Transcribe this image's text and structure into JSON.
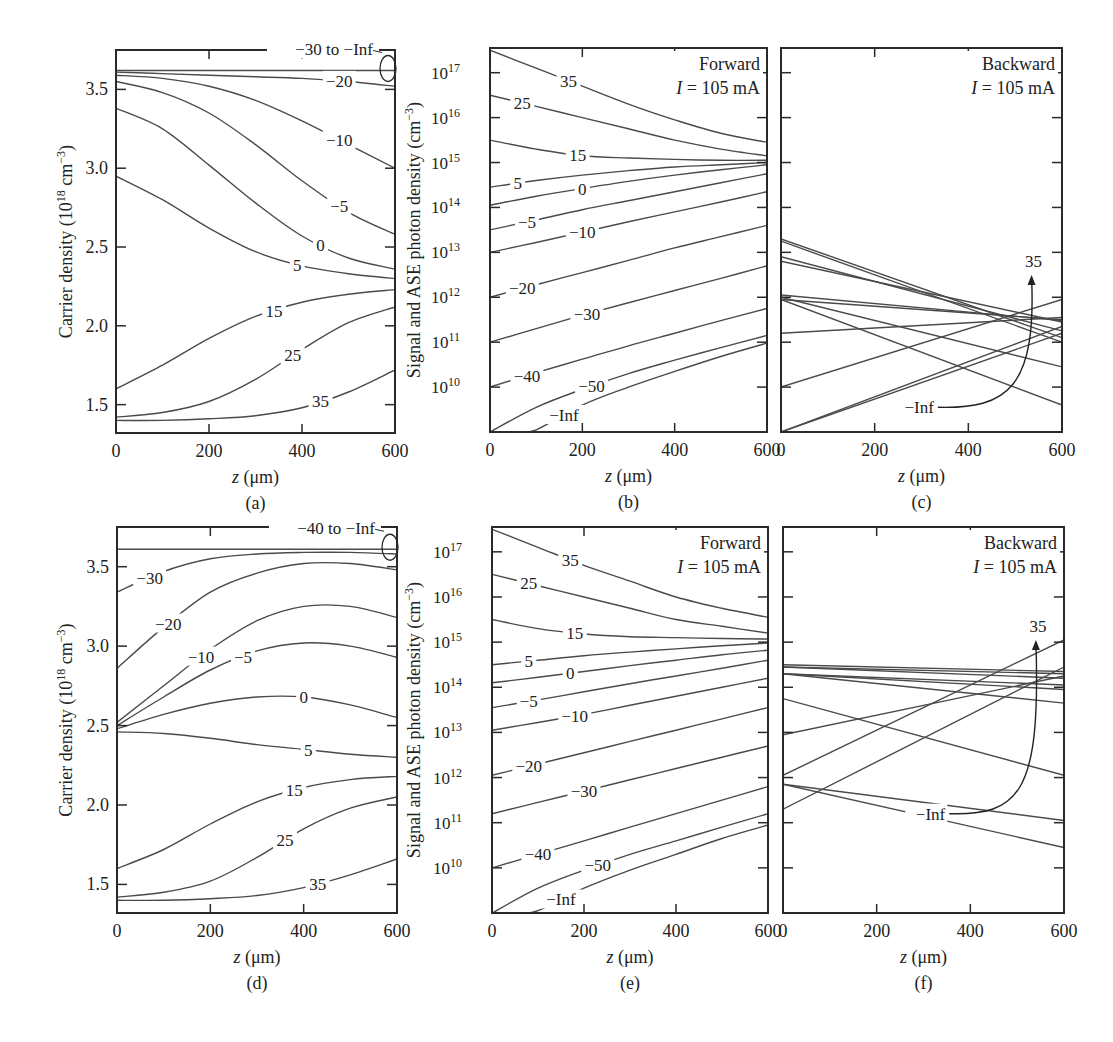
{
  "figure": {
    "line_color": "#4a4a4a",
    "axis_color": "#2a2a2a",
    "text_color": "#222222"
  },
  "chart_data": [
    {
      "id": "a",
      "panel_label": "(a)",
      "type": "line",
      "title": "",
      "xlabel": "z (μm)",
      "ylabel": "Carrier density (10^18 cm^-3)",
      "xlim": [
        0,
        600
      ],
      "ylim": [
        1.32,
        3.75
      ],
      "yscale": "linear",
      "xticks": [
        0,
        200,
        400,
        600
      ],
      "yticks": [
        1.5,
        2.0,
        2.5,
        3.0,
        3.5
      ],
      "ytick_labels": [
        "1.5",
        "2.0",
        "2.5",
        "3.0",
        "3.5"
      ],
      "grid": false,
      "annotation": "−30 to −Inf",
      "x": [
        0,
        100,
        200,
        300,
        400,
        500,
        600
      ],
      "series": [
        {
          "name": "−30 to −Inf",
          "values": [
            3.62,
            3.62,
            3.62,
            3.62,
            3.62,
            3.62,
            3.62
          ]
        },
        {
          "name": "−20",
          "values": [
            3.61,
            3.6,
            3.59,
            3.58,
            3.57,
            3.55,
            3.52
          ]
        },
        {
          "name": "−10",
          "values": [
            3.59,
            3.57,
            3.52,
            3.43,
            3.3,
            3.15,
            3.0
          ]
        },
        {
          "name": "−5",
          "values": [
            3.55,
            3.48,
            3.35,
            3.15,
            2.92,
            2.72,
            2.58
          ]
        },
        {
          "name": "0",
          "values": [
            3.38,
            3.25,
            3.02,
            2.78,
            2.57,
            2.43,
            2.36
          ]
        },
        {
          "name": "5",
          "values": [
            2.95,
            2.8,
            2.62,
            2.47,
            2.38,
            2.33,
            2.3
          ]
        },
        {
          "name": "15",
          "values": [
            1.6,
            1.75,
            1.92,
            2.06,
            2.15,
            2.2,
            2.23
          ]
        },
        {
          "name": "25",
          "values": [
            1.42,
            1.45,
            1.52,
            1.66,
            1.85,
            2.02,
            2.12
          ]
        },
        {
          "name": "35",
          "values": [
            1.4,
            1.4,
            1.41,
            1.43,
            1.48,
            1.58,
            1.72
          ]
        }
      ],
      "labels_at": [
        {
          "name": "−20",
          "x": 480
        },
        {
          "name": "−10",
          "x": 480
        },
        {
          "name": "−5",
          "x": 480
        },
        {
          "name": "0",
          "x": 440
        },
        {
          "name": "5",
          "x": 390
        },
        {
          "name": "15",
          "x": 340
        },
        {
          "name": "25",
          "x": 380
        },
        {
          "name": "35",
          "x": 440
        }
      ]
    },
    {
      "id": "b",
      "panel_label": "(b)",
      "type": "line",
      "title": "Forward",
      "subtitle": "I = 105 mA",
      "xlabel": "z (μm)",
      "ylabel": "Signal and ASE photon density (cm^-3)",
      "xlim": [
        0,
        600
      ],
      "ylim": [
        9.0,
        17.55
      ],
      "yscale": "log10",
      "xticks": [
        0,
        200,
        400,
        600
      ],
      "yticks": [
        10,
        11,
        12,
        13,
        14,
        15,
        16,
        17
      ],
      "ytick_labels": [
        "10^10",
        "10^11",
        "10^12",
        "10^13",
        "10^14",
        "10^15",
        "10^16",
        "10^17"
      ],
      "grid": false,
      "x": [
        0,
        100,
        200,
        300,
        400,
        500,
        600
      ],
      "series": [
        {
          "name": "35",
          "values": [
            17.5,
            17.1,
            16.7,
            16.3,
            15.95,
            15.65,
            15.45
          ]
        },
        {
          "name": "25",
          "values": [
            16.5,
            16.25,
            16.0,
            15.75,
            15.5,
            15.3,
            15.15
          ]
        },
        {
          "name": "15",
          "values": [
            15.5,
            15.3,
            15.15,
            15.1,
            15.07,
            15.05,
            15.05
          ]
        },
        {
          "name": "5",
          "values": [
            14.45,
            14.6,
            14.72,
            14.82,
            14.9,
            14.95,
            15.0
          ]
        },
        {
          "name": "0",
          "values": [
            14.05,
            14.25,
            14.42,
            14.58,
            14.72,
            14.84,
            14.95
          ]
        },
        {
          "name": "−5",
          "values": [
            13.5,
            13.72,
            13.95,
            14.15,
            14.35,
            14.55,
            14.75
          ]
        },
        {
          "name": "−10",
          "values": [
            13.0,
            13.22,
            13.45,
            13.68,
            13.9,
            14.12,
            14.35
          ]
        },
        {
          "name": "−20",
          "values": [
            12.0,
            12.28,
            12.55,
            12.82,
            13.1,
            13.35,
            13.6
          ]
        },
        {
          "name": "−30",
          "values": [
            11.0,
            11.3,
            11.6,
            11.88,
            12.15,
            12.42,
            12.7
          ]
        },
        {
          "name": "−40",
          "values": [
            10.0,
            10.32,
            10.62,
            10.92,
            11.2,
            11.48,
            11.75
          ]
        },
        {
          "name": "−50",
          "values": [
            9.0,
            9.55,
            9.95,
            10.3,
            10.6,
            10.88,
            11.15
          ]
        },
        {
          "name": "−Inf",
          "values": [
            null,
            9.05,
            9.6,
            10.0,
            10.35,
            10.68,
            10.98
          ]
        }
      ],
      "labels_at": [
        {
          "name": "35",
          "x": 170
        },
        {
          "name": "25",
          "x": 70
        },
        {
          "name": "15",
          "x": 190
        },
        {
          "name": "5",
          "x": 60
        },
        {
          "name": "0",
          "x": 200
        },
        {
          "name": "−5",
          "x": 80
        },
        {
          "name": "−10",
          "x": 200
        },
        {
          "name": "−20",
          "x": 70
        },
        {
          "name": "−30",
          "x": 210
        },
        {
          "name": "−40",
          "x": 80
        },
        {
          "name": "−50",
          "x": 220
        },
        {
          "name": "−Inf",
          "x": 160
        }
      ]
    },
    {
      "id": "c",
      "panel_label": "(c)",
      "type": "line",
      "title": "Backward",
      "subtitle": "I = 105 mA",
      "xlabel": "z (μm)",
      "ylabel": "",
      "xlim": [
        0,
        600
      ],
      "ylim": [
        9.0,
        17.55
      ],
      "yscale": "log10",
      "xticks": [
        0,
        200,
        400,
        600
      ],
      "yticks": [
        10,
        11,
        12,
        13,
        14,
        15,
        16,
        17
      ],
      "grid": false,
      "annotation": "−Inf → 35 (arrow)",
      "x": [
        0,
        600
      ],
      "series": [
        {
          "name": "35",
          "values": [
            10.0,
            11.95
          ]
        },
        {
          "name": "25",
          "values": [
            9.0,
            11.35
          ]
        },
        {
          "name": "15",
          "values": [
            9.0,
            11.2
          ]
        },
        {
          "name": "5",
          "values": [
            11.2,
            11.55
          ]
        },
        {
          "name": "0",
          "values": [
            11.95,
            11.5
          ]
        },
        {
          "name": "−5",
          "values": [
            12.05,
            11.48
          ]
        },
        {
          "name": "−10",
          "values": [
            12.8,
            11.45
          ]
        },
        {
          "name": "−20",
          "values": [
            12.9,
            11.25
          ]
        },
        {
          "name": "−30",
          "values": [
            13.3,
            11.1
          ]
        },
        {
          "name": "−40",
          "values": [
            13.25,
            11.0
          ]
        },
        {
          "name": "−50",
          "values": [
            12.0,
            10.45
          ]
        },
        {
          "name": "−Inf",
          "values": [
            11.95,
            9.6
          ]
        }
      ]
    },
    {
      "id": "d",
      "panel_label": "(d)",
      "type": "line",
      "title": "",
      "xlabel": "z (μm)",
      "ylabel": "Carrier density (10^18 cm^-3)",
      "xlim": [
        0,
        600
      ],
      "ylim": [
        1.32,
        3.75
      ],
      "yscale": "linear",
      "xticks": [
        0,
        200,
        400,
        600
      ],
      "yticks": [
        1.5,
        2.0,
        2.5,
        3.0,
        3.5
      ],
      "ytick_labels": [
        "1.5",
        "2.0",
        "2.5",
        "3.0",
        "3.5"
      ],
      "grid": false,
      "annotation": "−40 to −Inf",
      "x": [
        0,
        100,
        200,
        300,
        400,
        500,
        600
      ],
      "series": [
        {
          "name": "−40 to −Inf",
          "values": [
            3.61,
            3.61,
            3.61,
            3.61,
            3.61,
            3.61,
            3.61
          ]
        },
        {
          "name": "−30",
          "values": [
            3.34,
            3.47,
            3.55,
            3.58,
            3.59,
            3.59,
            3.58
          ]
        },
        {
          "name": "−20",
          "values": [
            2.86,
            3.12,
            3.34,
            3.46,
            3.52,
            3.52,
            3.48
          ]
        },
        {
          "name": "−10",
          "values": [
            2.52,
            2.75,
            2.98,
            3.16,
            3.25,
            3.25,
            3.18
          ]
        },
        {
          "name": "−5",
          "values": [
            2.5,
            2.68,
            2.85,
            2.97,
            3.02,
            3.0,
            2.93
          ]
        },
        {
          "name": "0",
          "values": [
            2.48,
            2.57,
            2.64,
            2.68,
            2.68,
            2.63,
            2.55
          ]
        },
        {
          "name": "5",
          "values": [
            2.46,
            2.45,
            2.42,
            2.38,
            2.35,
            2.32,
            2.3
          ]
        },
        {
          "name": "15",
          "values": [
            1.6,
            1.72,
            1.88,
            2.02,
            2.11,
            2.16,
            2.18
          ]
        },
        {
          "name": "25",
          "values": [
            1.42,
            1.45,
            1.52,
            1.67,
            1.85,
            1.98,
            2.05
          ]
        },
        {
          "name": "35",
          "values": [
            1.4,
            1.4,
            1.41,
            1.43,
            1.48,
            1.56,
            1.66
          ]
        }
      ],
      "labels_at": [
        {
          "name": "−30",
          "x": 70
        },
        {
          "name": "−20",
          "x": 110
        },
        {
          "name": "−10",
          "x": 180
        },
        {
          "name": "−5",
          "x": 270
        },
        {
          "name": "0",
          "x": 400
        },
        {
          "name": "5",
          "x": 410
        },
        {
          "name": "15",
          "x": 380
        },
        {
          "name": "25",
          "x": 360
        },
        {
          "name": "35",
          "x": 430
        }
      ]
    },
    {
      "id": "e",
      "panel_label": "(e)",
      "type": "line",
      "title": "Forward",
      "subtitle": "I = 105 mA",
      "xlabel": "z (μm)",
      "ylabel": "Signal and ASE photon density (cm^-3)",
      "xlim": [
        0,
        600
      ],
      "ylim": [
        9.0,
        17.55
      ],
      "yscale": "log10",
      "xticks": [
        0,
        200,
        400,
        600
      ],
      "yticks": [
        10,
        11,
        12,
        13,
        14,
        15,
        16,
        17
      ],
      "ytick_labels": [
        "10^10",
        "10^11",
        "10^12",
        "10^13",
        "10^14",
        "10^15",
        "10^16",
        "10^17"
      ],
      "grid": false,
      "x": [
        0,
        100,
        200,
        300,
        400,
        500,
        600
      ],
      "series": [
        {
          "name": "35",
          "values": [
            17.5,
            17.1,
            16.7,
            16.35,
            16.0,
            15.75,
            15.55
          ]
        },
        {
          "name": "25",
          "values": [
            16.5,
            16.25,
            16.0,
            15.75,
            15.5,
            15.35,
            15.2
          ]
        },
        {
          "name": "15",
          "values": [
            15.5,
            15.3,
            15.18,
            15.12,
            15.1,
            15.08,
            15.07
          ]
        },
        {
          "name": "5",
          "values": [
            14.5,
            14.6,
            14.7,
            14.78,
            14.85,
            14.92,
            14.98
          ]
        },
        {
          "name": "0",
          "values": [
            14.1,
            14.22,
            14.35,
            14.48,
            14.6,
            14.72,
            14.82
          ]
        },
        {
          "name": "−5",
          "values": [
            13.55,
            13.72,
            13.9,
            14.08,
            14.25,
            14.42,
            14.6
          ]
        },
        {
          "name": "−10",
          "values": [
            13.05,
            13.22,
            13.4,
            13.6,
            13.8,
            14.0,
            14.2
          ]
        },
        {
          "name": "−20",
          "values": [
            12.05,
            12.3,
            12.55,
            12.8,
            13.05,
            13.3,
            13.55
          ]
        },
        {
          "name": "−30",
          "values": [
            11.2,
            11.45,
            11.7,
            11.95,
            12.2,
            12.45,
            12.7
          ]
        },
        {
          "name": "−40",
          "values": [
            10.0,
            10.3,
            10.6,
            10.9,
            11.2,
            11.5,
            11.8
          ]
        },
        {
          "name": "−50",
          "values": [
            9.0,
            9.55,
            9.95,
            10.3,
            10.6,
            10.9,
            11.2
          ]
        },
        {
          "name": "−Inf",
          "values": [
            null,
            9.05,
            9.55,
            9.95,
            10.3,
            10.65,
            10.95
          ]
        }
      ],
      "labels_at": [
        {
          "name": "35",
          "x": 170
        },
        {
          "name": "25",
          "x": 80
        },
        {
          "name": "15",
          "x": 180
        },
        {
          "name": "5",
          "x": 80
        },
        {
          "name": "0",
          "x": 170
        },
        {
          "name": "−5",
          "x": 80
        },
        {
          "name": "−10",
          "x": 180
        },
        {
          "name": "−20",
          "x": 80
        },
        {
          "name": "−30",
          "x": 200
        },
        {
          "name": "−40",
          "x": 100
        },
        {
          "name": "−50",
          "x": 230
        },
        {
          "name": "−Inf",
          "x": 150
        }
      ]
    },
    {
      "id": "f",
      "panel_label": "(f)",
      "type": "line",
      "title": "Backward",
      "subtitle": "I = 105 mA",
      "xlabel": "z (μm)",
      "ylabel": "",
      "xlim": [
        0,
        600
      ],
      "ylim": [
        9.0,
        17.55
      ],
      "yscale": "log10",
      "xticks": [
        0,
        200,
        400,
        600
      ],
      "yticks": [
        10,
        11,
        12,
        13,
        14,
        15,
        16,
        17
      ],
      "grid": false,
      "annotation": "−Inf → 35 (arrow)",
      "x": [
        0,
        600
      ],
      "series": [
        {
          "name": "35",
          "values": [
            12.05,
            15.05
          ]
        },
        {
          "name": "25",
          "values": [
            11.3,
            14.45
          ]
        },
        {
          "name": "15",
          "values": [
            12.95,
            14.25
          ]
        },
        {
          "name": "5",
          "values": [
            14.5,
            14.35
          ]
        },
        {
          "name": "0",
          "values": [
            14.45,
            14.3
          ]
        },
        {
          "name": "−5",
          "values": [
            14.45,
            14.2
          ]
        },
        {
          "name": "−10",
          "values": [
            14.3,
            14.05
          ]
        },
        {
          "name": "−20",
          "values": [
            14.3,
            13.95
          ]
        },
        {
          "name": "−30",
          "values": [
            14.3,
            13.65
          ]
        },
        {
          "name": "−40",
          "values": [
            13.75,
            12.05
          ]
        },
        {
          "name": "−50",
          "values": [
            11.85,
            11.05
          ]
        },
        {
          "name": "−Inf",
          "values": [
            11.85,
            10.45
          ]
        }
      ]
    }
  ]
}
